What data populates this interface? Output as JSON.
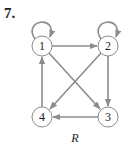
{
  "problem": {
    "number": "7."
  },
  "graph": {
    "caption": "R",
    "nodes": [
      {
        "id": "1",
        "label": "1",
        "x": 42,
        "y": 46
      },
      {
        "id": "2",
        "label": "2",
        "x": 108,
        "y": 46
      },
      {
        "id": "3",
        "label": "3",
        "x": 108,
        "y": 117
      },
      {
        "id": "4",
        "label": "4",
        "x": 42,
        "y": 117
      }
    ],
    "edges": [
      {
        "from": "1",
        "to": "1",
        "type": "loop"
      },
      {
        "from": "2",
        "to": "2",
        "type": "loop"
      },
      {
        "from": "1",
        "to": "2"
      },
      {
        "from": "1",
        "to": "3"
      },
      {
        "from": "2",
        "to": "3"
      },
      {
        "from": "2",
        "to": "4"
      },
      {
        "from": "3",
        "to": "4"
      },
      {
        "from": "4",
        "to": "1"
      }
    ],
    "colors": {
      "edge": "#8c8c8c",
      "node_stroke": "#8c8c8c",
      "text": "#222222"
    }
  }
}
